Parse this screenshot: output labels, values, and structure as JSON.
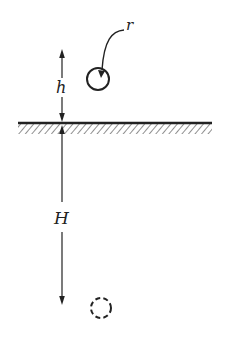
{
  "diagram": {
    "labels": {
      "radius": "r",
      "height": "h",
      "depth": "H"
    },
    "elements": {
      "surface": "hatched ground plane",
      "sphere": "solid circle of radius r above surface",
      "image_sphere": "dashed circle below surface",
      "height_arrow": "double-headed arrow from sphere level to surface, labeled h",
      "depth_arrow": "double-headed arrow from surface down to image level, labeled H"
    },
    "colors": {
      "ink": "#222222",
      "background": "#ffffff"
    }
  }
}
